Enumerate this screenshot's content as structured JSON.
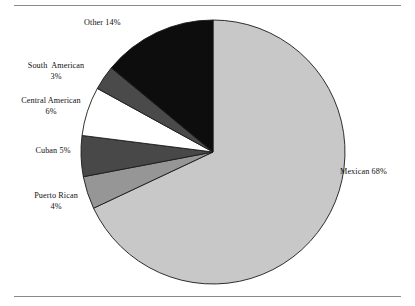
{
  "figure": {
    "background_color": "#ffffff",
    "rule_color": "#8a8a8a",
    "top_rule_name": "top-divider",
    "bottom_rule_name": "bottom-divider"
  },
  "chart_data": {
    "type": "pie",
    "title": "",
    "subtitle": "",
    "xlabel": "",
    "ylabel": "",
    "legend_position": "none",
    "grid": false,
    "start_angle_deg": 0,
    "direction": "clockwise",
    "categories": [
      "Mexican",
      "Puerto Rican",
      "Cuban",
      "Central American",
      "South American",
      "Other"
    ],
    "values": [
      68,
      4,
      5,
      6,
      3,
      14
    ],
    "units": "percent",
    "total": 100,
    "colors": [
      "#c8c8c8",
      "#969696",
      "#484848",
      "#ffffff",
      "#4a4a4a",
      "#0d0d0d"
    ],
    "slice_edge_color": "#1a1a1a",
    "slices": [
      {
        "label": "Mexican",
        "value": 68,
        "value_text": "68%",
        "color": "#c8c8c8",
        "label_text": "Mexican 68%"
      },
      {
        "label": "Puerto Rican",
        "value": 4,
        "value_text": "4%",
        "color": "#969696",
        "label_text": "Puerto Rican\n4%"
      },
      {
        "label": "Cuban",
        "value": 5,
        "value_text": "5%",
        "color": "#484848",
        "label_text": "Cuban 5%"
      },
      {
        "label": "Central American",
        "value": 6,
        "value_text": "6%",
        "color": "#ffffff",
        "label_text": "Central American\n6%"
      },
      {
        "label": "South American",
        "value": 3,
        "value_text": "3%",
        "color": "#4a4a4a",
        "label_text": "South  American\n3%"
      },
      {
        "label": "Other",
        "value": 14,
        "value_text": "14%",
        "color": "#0d0d0d",
        "label_text": "Other 14%"
      }
    ]
  },
  "labels": {
    "mexican": "Mexican 68%",
    "puerto_rican": "Puerto Rican\n4%",
    "cuban": "Cuban 5%",
    "central_american": "Central American\n6%",
    "south_american": "South  American\n3%",
    "other": "Other 14%"
  }
}
